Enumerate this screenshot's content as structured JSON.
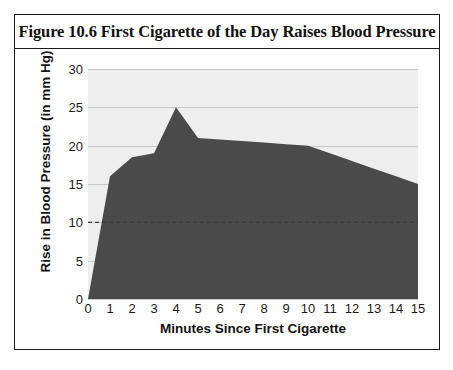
{
  "figure": {
    "title": "Figure 10.6 First Cigarette of the Day Raises Blood Pressure"
  },
  "chart_data": {
    "type": "area",
    "title": "Figure 10.6 First Cigarette of the Day Raises Blood Pressure",
    "xlabel": "Minutes Since First Cigarette",
    "ylabel": "Rise in Blood Pressure (in mm Hg)",
    "x": [
      0,
      1,
      2,
      3,
      4,
      5,
      6,
      7,
      8,
      9,
      10,
      11,
      12,
      13,
      14,
      15
    ],
    "values": [
      0,
      16,
      18.5,
      19,
      25,
      21,
      20.8,
      20.6,
      20.4,
      20.2,
      20,
      19,
      18,
      17,
      16,
      15
    ],
    "series": [
      {
        "name": "Rise in Blood Pressure",
        "values": [
          0,
          16,
          18.5,
          19,
          25,
          21,
          20.8,
          20.6,
          20.4,
          20.2,
          20,
          19,
          18,
          17,
          16,
          15
        ]
      }
    ],
    "xlim": [
      0,
      15
    ],
    "ylim": [
      0,
      30
    ],
    "xticks": [
      "0",
      "1",
      "2",
      "3",
      "4",
      "5",
      "6",
      "7",
      "8",
      "9",
      "10",
      "11",
      "12",
      "13",
      "14",
      "15"
    ],
    "yticks": [
      "0",
      "5",
      "10",
      "15",
      "20",
      "25",
      "30"
    ],
    "grid": "horizontal",
    "legend": "none",
    "reference_line": {
      "value": 10,
      "style": "dashed"
    },
    "colors": {
      "area_fill": "#4a4a4a",
      "plot_background": "#eeeeee",
      "gridline": "#c9c9c9",
      "reference_line": "#3a3a3a",
      "text": "#1a1a1a",
      "border": "#1b1b1b"
    }
  }
}
